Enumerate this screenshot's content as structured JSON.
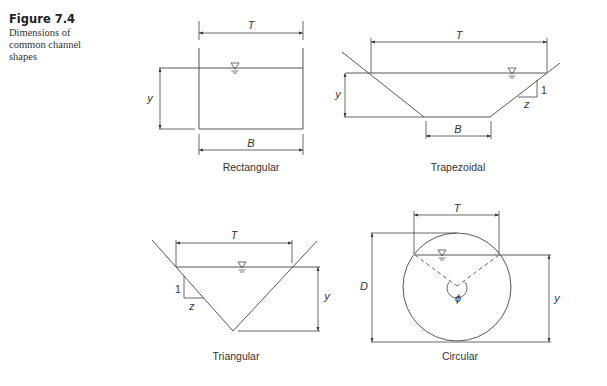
{
  "figure": {
    "number": "Figure 7.4",
    "caption_lines": [
      "Dimensions of",
      "common channel",
      "shapes"
    ]
  },
  "shapes": {
    "rectangular": {
      "name": "Rectangular",
      "labels": {
        "top_width": "T",
        "depth": "y",
        "bottom_width": "B"
      }
    },
    "trapezoidal": {
      "name": "Trapezoidal",
      "labels": {
        "top_width": "T",
        "depth": "y",
        "bottom_width": "B",
        "slope_vertical": "1",
        "slope_horizontal": "z"
      }
    },
    "triangular": {
      "name": "Triangular",
      "labels": {
        "top_width": "T",
        "depth": "y",
        "slope_vertical": "1",
        "slope_horizontal": "z"
      }
    },
    "circular": {
      "name": "Circular",
      "labels": {
        "top_width": "T",
        "diameter": "D",
        "depth": "y",
        "angle": "ϕ"
      }
    }
  },
  "symbols": {
    "water_surface": "▽"
  }
}
